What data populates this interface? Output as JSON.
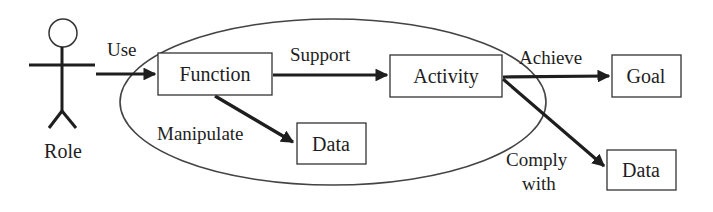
{
  "diagram": {
    "actor": {
      "label": "Role"
    },
    "nodes": {
      "function": "Function",
      "activity": "Activity",
      "data_inner": "Data",
      "goal": "Goal",
      "data_outer": "Data"
    },
    "edges": {
      "use": "Use",
      "support": "Support",
      "manipulate": "Manipulate",
      "achieve": "Achieve",
      "comply_line1": "Comply",
      "comply_line2": "with"
    },
    "colors": {
      "line": "#1e1e1e",
      "background": "#ffffff"
    }
  }
}
